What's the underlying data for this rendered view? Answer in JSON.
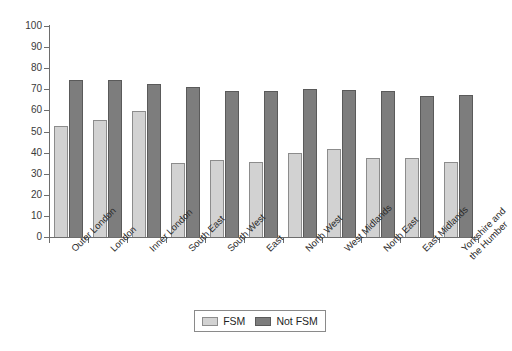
{
  "chart_data": {
    "type": "bar",
    "title": "",
    "xlabel": "",
    "ylabel": "",
    "ylim": [
      0,
      100
    ],
    "ytick_step": 10,
    "grid": false,
    "legend_position": "bottom-center",
    "categories": [
      "Outer London",
      "London",
      "Inner London",
      "South East",
      "South West",
      "East",
      "North West",
      "West Midlands",
      "North East",
      "East Midlands",
      "Yorkshire and\nthe Humber"
    ],
    "ytick_labels": [
      "0",
      "10",
      "20",
      "30",
      "40",
      "50",
      "60",
      "70",
      "80",
      "90",
      "100"
    ],
    "series": [
      {
        "name": "FSM",
        "color": "#d2d2d2",
        "values": [
          52.5,
          55.5,
          59.5,
          35.0,
          36.5,
          35.5,
          40.0,
          41.5,
          37.5,
          37.5,
          35.5
        ]
      },
      {
        "name": "Not FSM",
        "color": "#7d7d7d",
        "values": [
          74.5,
          74.5,
          72.5,
          71.0,
          69.0,
          69.0,
          70.0,
          69.5,
          69.0,
          67.0,
          67.5
        ]
      }
    ]
  },
  "legend": {
    "items": [
      {
        "label": "FSM",
        "swatch": "fsm"
      },
      {
        "label": "Not FSM",
        "swatch": "notfsm"
      }
    ]
  }
}
